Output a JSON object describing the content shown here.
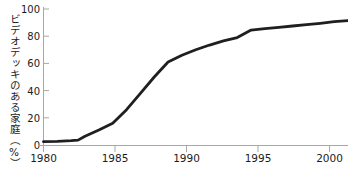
{
  "chart_data": {
    "type": "line",
    "title": "",
    "subtitle": "",
    "xlabel": "",
    "ylabel": "ビデオデッキのある家庭（%）",
    "xlim": [
      1980,
      2002
    ],
    "ylim": [
      0,
      100
    ],
    "grid": false,
    "legend": "none",
    "x_ticks": [
      1980,
      1985,
      1990,
      1995,
      2000
    ],
    "x_tick_labels": [
      "1980",
      "1985",
      "1990",
      "1995",
      "2000"
    ],
    "y_ticks": [
      0,
      20,
      40,
      60,
      80,
      100
    ],
    "y_tick_labels": [
      "0",
      "20",
      "40",
      "60",
      "80",
      "100"
    ],
    "series": [
      {
        "name": "ビデオデッキのある家庭",
        "color": "#1f1f1f",
        "line_width": 2.8,
        "x": [
          1980,
          1981,
          1982,
          1982.5,
          1983,
          1984,
          1985,
          1986,
          1987,
          1988,
          1989,
          1990,
          1991,
          1992,
          1993,
          1994,
          1995,
          1996,
          1997,
          1998,
          1999,
          2000,
          2001,
          2002
        ],
        "y": [
          2.5,
          2.7,
          3.2,
          3.6,
          6.5,
          11,
          16,
          26,
          38,
          50,
          61,
          66,
          70,
          73.5,
          76.5,
          79,
          84.5,
          85.5,
          86.5,
          87.5,
          88.5,
          89.5,
          90.7,
          91.5
        ]
      }
    ],
    "annotations": []
  },
  "axis": {
    "line_color": "#a8a8a8",
    "tick_color": "#a8a8a8",
    "label_color": "#1c1c1c"
  }
}
